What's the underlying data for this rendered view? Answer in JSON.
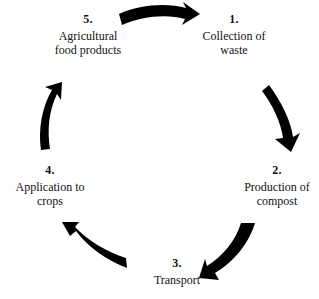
{
  "diagram": {
    "type": "circular-process",
    "direction": "clockwise",
    "background_color": "#ffffff",
    "arrow_color": "#000000",
    "text_color": "#111111",
    "stages": [
      {
        "number": "1.",
        "label": "Collection of\nwaste",
        "name": "collection-of-waste"
      },
      {
        "number": "2.",
        "label": "Production of\ncompost",
        "name": "production-of-compost"
      },
      {
        "number": "3.",
        "label": "Transport",
        "name": "transport"
      },
      {
        "number": "4.",
        "label": "Application to\ncrops",
        "name": "application-to-crops"
      },
      {
        "number": "5.",
        "label": "Agricultural\nfood products",
        "name": "agricultural-food-products"
      }
    ],
    "arrows": [
      {
        "name": "arrow-top-right",
        "from": "5",
        "to": "1",
        "direction": "right"
      },
      {
        "name": "arrow-right-down",
        "from": "1",
        "to": "2",
        "direction": "down"
      },
      {
        "name": "arrow-bottom-right",
        "from": "2",
        "to": "3",
        "direction": "down-left"
      },
      {
        "name": "arrow-bottom-left",
        "from": "3",
        "to": "4",
        "direction": "up-left"
      },
      {
        "name": "arrow-left-up",
        "from": "4",
        "to": "5",
        "direction": "up"
      }
    ]
  }
}
